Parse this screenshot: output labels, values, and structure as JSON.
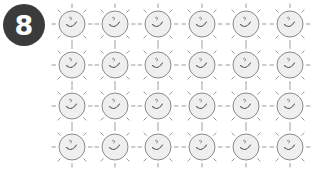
{
  "badge": {
    "number": "8",
    "color": "#3b3b3b"
  },
  "suns": {
    "rows": 4,
    "columns": 6,
    "count": 24,
    "icon": "smiling-sun-icon",
    "fill": "#efefef",
    "stroke": "#8a8a8a",
    "ray_color": "#9a9a9a",
    "col_centers": [
      72,
      115,
      158,
      202,
      246,
      290
    ],
    "row_centers": [
      24,
      65,
      106,
      147
    ]
  }
}
